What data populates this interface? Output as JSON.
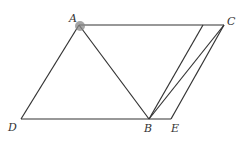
{
  "figure": {
    "type": "geometry-diagram",
    "points": {
      "A": {
        "label": "A",
        "x": 79,
        "y": 25
      },
      "C": {
        "label": "C",
        "x": 224,
        "y": 25
      },
      "D": {
        "label": "D",
        "x": 21,
        "y": 119
      },
      "B": {
        "label": "B",
        "x": 149,
        "y": 119
      },
      "E": {
        "label": "E",
        "x": 171,
        "y": 119
      },
      "F": {
        "label": "",
        "x": 203,
        "y": 25
      }
    },
    "segments": [
      [
        "A",
        "D"
      ],
      [
        "D",
        "E"
      ],
      [
        "A",
        "B"
      ],
      [
        "A",
        "C"
      ],
      [
        "B",
        "C"
      ],
      [
        "B",
        "F"
      ],
      [
        "C",
        "E"
      ]
    ],
    "highlight_point": "A",
    "highlight_color": "#888888",
    "caption": ""
  }
}
